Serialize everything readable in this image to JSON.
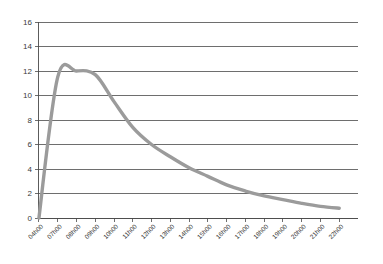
{
  "chart_data": {
    "type": "line",
    "title": "",
    "subtitle": "",
    "xlabel": "",
    "ylabel": "",
    "ylim": [
      0,
      16
    ],
    "y_ticks": [
      0,
      2,
      4,
      6,
      8,
      10,
      12,
      14,
      16
    ],
    "y_tick_labels": [
      "0",
      "2",
      "4",
      "6",
      "8",
      "10",
      "12",
      "14",
      "16"
    ],
    "grid": "horizontal",
    "legend": "none",
    "categories": [
      "04h00",
      "07h00",
      "08h00",
      "09h00",
      "10h00",
      "11h00",
      "12h00",
      "13h00",
      "14h00",
      "15h00",
      "16h00",
      "17h00",
      "18h00",
      "19h00",
      "20h00",
      "21h00",
      "22h00"
    ],
    "series": [
      {
        "name": "series-1",
        "color": "#9b9b9b",
        "values": [
          0,
          11.5,
          12.0,
          11.7,
          9.5,
          7.4,
          6.0,
          5.0,
          4.1,
          3.4,
          2.7,
          2.2,
          1.8,
          1.5,
          1.2,
          0.95,
          0.8
        ]
      }
    ]
  },
  "axes": {
    "y_axis_name": "value-axis",
    "x_axis_name": "time-axis"
  },
  "colors": {
    "series": "#9b9b9b",
    "gridline": "#4a4a4a",
    "tick_text": "#3b3b3b",
    "background": "#ffffff"
  }
}
